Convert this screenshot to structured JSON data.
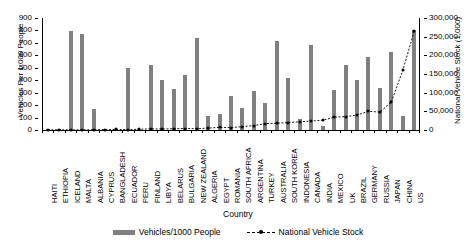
{
  "chart_data": {
    "type": "bar",
    "title": "",
    "xlabel": "Country",
    "ylabel": "Vehicles Per 1,000 People",
    "ylabel_right": "National Vehicle Stock (1,000)",
    "ylim": [
      0,
      900
    ],
    "ylim_right": [
      0,
      300000
    ],
    "yticks": [
      0,
      100,
      200,
      300,
      400,
      500,
      600,
      700,
      800,
      900
    ],
    "ytick_labels": [
      "0",
      "100",
      "200",
      "300",
      "400",
      "500",
      "600",
      "700",
      "800",
      "900"
    ],
    "yticks_right": [
      0,
      50000,
      100000,
      150000,
      200000,
      250000,
      300000
    ],
    "ytick_labels_right": [
      "0",
      "50,000",
      "100,000",
      "150,000",
      "200,000",
      "250,000",
      "300,000"
    ],
    "grid": false,
    "legend_position": "bottom",
    "categories": [
      "HAITI",
      "ETHIOPIA",
      "ICELAND",
      "MALTA",
      "ALBANIA",
      "CYPRUS",
      "BANGLADESH",
      "ECUADOR",
      "PERU",
      "FINLAND",
      "LIBYA",
      "BELARUS",
      "BULGARIA",
      "NEW ZEALAND",
      "ALGERIA",
      "EGYPT",
      "ROMANIA",
      "SOUTH AFRICA",
      "ARGENTINA",
      "TURKEY",
      "AUSTRALIA",
      "SOUTH KOREA",
      "INDONESIA",
      "CANADA",
      "INDIA",
      "MEXICO",
      "UK",
      "BRAZIL",
      "GERMANY",
      "RUSSIA",
      "JAPAN",
      "CHINA",
      "US"
    ],
    "series": [
      {
        "name": "Vehicles/1000 People",
        "type": "bar",
        "color": "#808080",
        "axis": "left",
        "values": [
          5,
          5,
          795,
          775,
          165,
          10,
          8,
          500,
          8,
          525,
          405,
          330,
          440,
          740,
          115,
          125,
          270,
          175,
          310,
          215,
          715,
          420,
          85,
          680,
          30,
          320,
          520,
          400,
          590,
          340,
          630,
          115,
          800
        ]
      },
      {
        "name": "National Vehicle Stock",
        "type": "line",
        "color": "#000000",
        "linestyle": "dashed",
        "marker": "diamond",
        "axis": "right",
        "values": [
          300,
          500,
          300,
          400,
          600,
          800,
          1500,
          1200,
          2000,
          3000,
          2500,
          3500,
          4000,
          3500,
          5000,
          7000,
          6500,
          9000,
          12000,
          17000,
          18000,
          20000,
          22000,
          24000,
          26000,
          34000,
          36000,
          40000,
          50000,
          48000,
          75000,
          160000,
          265000
        ]
      }
    ],
    "legend": [
      {
        "label": "Vehicles/1000 People",
        "marker": "bar",
        "color": "#808080"
      },
      {
        "label": "National Vehicle Stock",
        "marker": "dashed-line-diamond",
        "color": "#000000"
      }
    ]
  }
}
